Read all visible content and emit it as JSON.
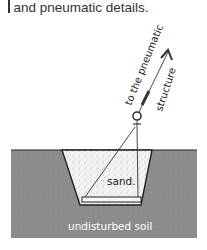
{
  "caption": {
    "text": "and pneumatic details."
  },
  "diagram": {
    "labels": {
      "to_pneumatic": "to the pneumatic",
      "structure": "structure",
      "sand": "sand.",
      "soil": "undisturbed soil"
    },
    "colors": {
      "soil": "#8c8c8c",
      "sand": "#f2f2f2",
      "line": "#222222",
      "soil_text": "#ffffff"
    }
  }
}
